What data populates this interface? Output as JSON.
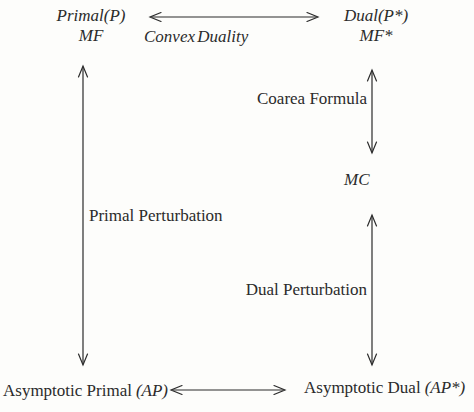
{
  "colors": {
    "background": "#fdfdfb",
    "ink": "#2b2b2b"
  },
  "diagram": {
    "nodes": {
      "primal": {
        "line1": "Primal(P)",
        "line2": "MF"
      },
      "dual": {
        "line1": "Dual(P*)",
        "line2": "MF*"
      },
      "mc": {
        "label": "MC"
      },
      "asymptotic_primal": {
        "text": "Asymptotic Primal",
        "math": "(AP)"
      },
      "asymptotic_dual": {
        "text": "Asymptotic Dual",
        "math": "(AP*)"
      }
    },
    "edges": {
      "convex_duality": {
        "label": "Convex Duality"
      },
      "coarea_formula": {
        "label": "Coarea Formula"
      },
      "primal_perturbation": {
        "label": "Primal Perturbation"
      },
      "dual_perturbation": {
        "label": "Dual Perturbation"
      }
    }
  }
}
